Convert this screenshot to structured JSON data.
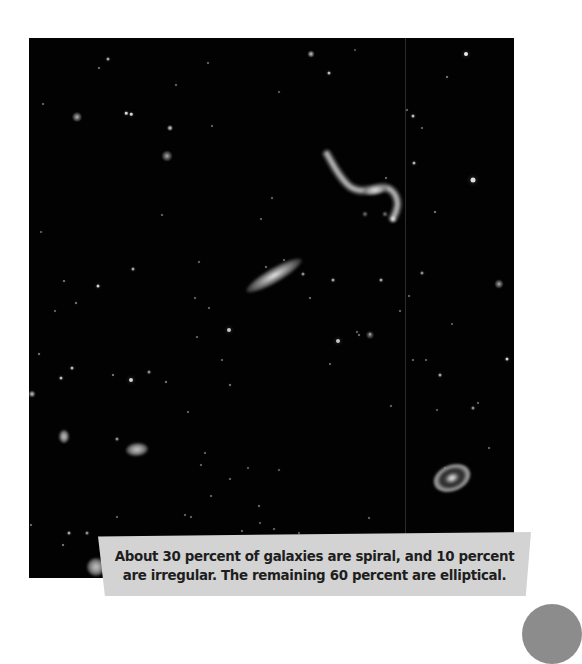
{
  "photo": {
    "alt": "Deep-space telescope image showing stars and several galaxies of different shapes",
    "background": "#020202",
    "stars": [
      [
        48,
        79,
        10,
        0.75
      ],
      [
        97,
        75,
        2.5,
        0.9
      ],
      [
        102,
        76,
        2.5,
        0.9
      ],
      [
        141,
        90,
        6,
        0.95
      ],
      [
        138,
        118,
        11,
        0.7
      ],
      [
        282,
        16,
        7,
        0.85
      ],
      [
        300,
        35,
        3,
        0.8
      ],
      [
        437,
        16,
        4,
        1.0
      ],
      [
        444,
        142,
        5,
        0.95
      ],
      [
        418,
        39,
        2,
        0.6
      ],
      [
        70,
        30,
        2,
        0.55
      ],
      [
        79,
        21,
        3,
        0.7
      ],
      [
        179,
        25,
        2,
        0.5
      ],
      [
        183,
        88,
        2,
        0.5
      ],
      [
        14,
        66,
        2,
        0.5
      ],
      [
        147,
        47,
        2,
        0.5
      ],
      [
        243,
        160,
        2,
        0.5
      ],
      [
        357,
        140,
        2,
        0.55
      ],
      [
        406,
        174,
        2,
        0.6
      ],
      [
        378,
        72,
        2,
        0.5
      ],
      [
        393,
        90,
        2,
        0.5
      ],
      [
        385,
        125,
        3,
        0.75
      ],
      [
        384,
        78,
        3,
        0.8
      ],
      [
        470,
        246,
        9,
        0.7
      ],
      [
        478,
        321,
        3,
        0.9
      ],
      [
        411,
        337,
        3,
        0.7
      ],
      [
        444,
        370,
        3,
        0.6
      ],
      [
        35,
        243,
        2,
        0.6
      ],
      [
        69,
        248,
        3,
        0.9
      ],
      [
        47,
        265,
        2,
        0.6
      ],
      [
        104,
        231,
        3,
        0.7
      ],
      [
        133,
        177,
        2,
        0.5
      ],
      [
        180,
        270,
        2,
        0.5
      ],
      [
        166,
        260,
        2,
        0.5
      ],
      [
        170,
        224,
        2,
        0.5
      ],
      [
        10,
        316,
        2,
        0.6
      ],
      [
        43,
        330,
        3,
        0.8
      ],
      [
        84,
        337,
        2,
        0.6
      ],
      [
        32,
        340,
        3,
        0.8
      ],
      [
        102,
        342,
        4,
        0.9
      ],
      [
        120,
        334,
        3,
        0.6
      ],
      [
        137,
        344,
        2,
        0.6
      ],
      [
        159,
        374,
        2,
        0.5
      ],
      [
        88,
        401,
        3,
        0.6
      ],
      [
        201,
        347,
        2,
        0.6
      ],
      [
        237,
        229,
        2,
        0.55
      ],
      [
        255,
        222,
        2,
        0.5
      ],
      [
        281,
        260,
        2,
        0.55
      ],
      [
        193,
        322,
        2,
        0.5
      ],
      [
        168,
        299,
        2,
        0.5
      ],
      [
        200,
        292,
        4,
        0.85
      ],
      [
        309,
        303,
        4,
        0.85
      ],
      [
        330,
        297,
        2,
        0.55
      ],
      [
        301,
        326,
        2,
        0.5
      ],
      [
        328,
        294,
        2,
        0.5
      ],
      [
        274,
        236,
        3,
        0.6
      ],
      [
        304,
        242,
        3,
        0.7
      ],
      [
        341,
        297,
        8,
        0.55
      ],
      [
        352,
        242,
        3,
        0.7
      ],
      [
        341,
        296,
        2,
        0.5
      ],
      [
        393,
        235,
        3,
        0.6
      ],
      [
        380,
        258,
        2,
        0.5
      ],
      [
        371,
        273,
        2,
        0.5
      ],
      [
        384,
        322,
        2,
        0.5
      ],
      [
        362,
        368,
        2,
        0.5
      ],
      [
        397,
        322,
        2,
        0.5
      ],
      [
        219,
        430,
        2,
        0.45
      ],
      [
        201,
        441,
        2,
        0.5
      ],
      [
        230,
        468,
        2,
        0.55
      ],
      [
        213,
        493,
        2,
        0.5
      ],
      [
        231,
        485,
        2,
        0.45
      ],
      [
        250,
        432,
        2,
        0.45
      ],
      [
        285,
        514,
        2,
        0.45
      ],
      [
        270,
        495,
        2,
        0.45
      ],
      [
        245,
        491,
        2,
        0.5
      ],
      [
        156,
        477,
        2,
        0.5
      ],
      [
        182,
        458,
        2,
        0.5
      ],
      [
        162,
        479,
        2,
        0.5
      ],
      [
        130,
        505,
        2,
        0.5
      ],
      [
        66,
        557,
        2,
        0.6
      ],
      [
        86,
        513,
        2,
        0.45
      ],
      [
        40,
        495,
        3,
        0.7
      ],
      [
        34,
        507,
        2,
        0.6
      ],
      [
        2,
        487,
        2,
        0.55
      ],
      [
        58,
        495,
        3,
        0.6
      ],
      [
        88,
        479,
        2,
        0.5
      ],
      [
        172,
        427,
        2,
        0.5
      ],
      [
        176,
        415,
        2,
        0.5
      ],
      [
        340,
        480,
        2,
        0.5
      ],
      [
        416,
        430,
        2,
        0.5
      ],
      [
        440,
        500,
        2,
        0.45
      ],
      [
        452,
        499,
        2,
        0.45
      ],
      [
        250,
        54,
        2,
        0.45
      ],
      [
        326,
        12,
        2,
        0.4
      ],
      [
        460,
        410,
        2,
        0.5
      ],
      [
        3,
        356,
        7,
        0.85
      ],
      [
        408,
        372,
        2,
        0.45
      ],
      [
        423,
        286,
        2,
        0.45
      ],
      [
        449,
        365,
        2,
        0.5
      ],
      [
        12,
        194,
        2,
        0.45
      ],
      [
        26,
        273,
        2,
        0.5
      ],
      [
        232,
        181,
        2,
        0.5
      ]
    ],
    "galaxies": [
      {
        "name": "edge-on-spiral",
        "kind": "g-edge",
        "x": 245,
        "y": 237,
        "w": 64,
        "h": 15,
        "rot": -30
      },
      {
        "name": "ring-galaxy",
        "kind": "g-ring",
        "x": 423,
        "y": 440,
        "w": 38,
        "h": 26,
        "rot": -22
      },
      {
        "name": "small-elliptical",
        "kind": "g-blob",
        "x": 108,
        "y": 411,
        "w": 22,
        "h": 13,
        "rot": -5
      },
      {
        "name": "left-edge-galaxy",
        "kind": "g-blob",
        "x": 35,
        "y": 398,
        "w": 10,
        "h": 13,
        "rot": 0
      },
      {
        "name": "bright-star-cluster",
        "kind": "g-blob",
        "x": 67,
        "y": 529,
        "w": 18,
        "h": 18,
        "rot": 0
      }
    ],
    "seam_x": 376
  },
  "caption": {
    "line1": "About 30 percent of galaxies are spiral, and 10 percent",
    "line2": "are irregular. The remaining 60 percent are elliptical.",
    "background": "#d3d3d3",
    "text_color": "#1e1e1e"
  },
  "page_tab": {
    "color": "#8c8c8c"
  }
}
